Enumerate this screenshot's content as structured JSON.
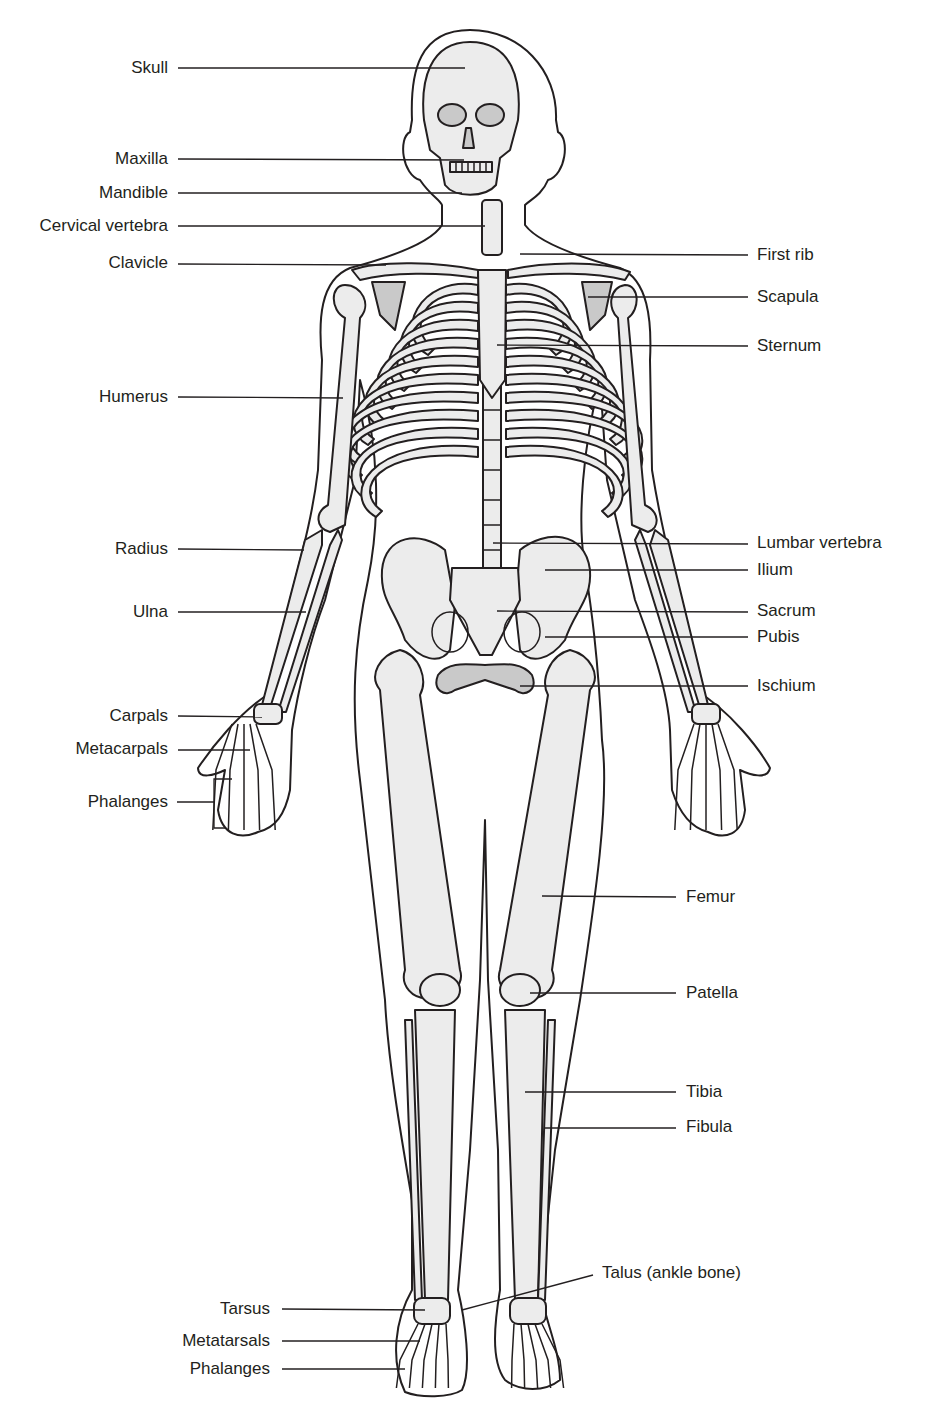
{
  "figure": {
    "colors": {
      "ink": "#231f20",
      "bone_fill": "#ececec",
      "shaded_bone": "#c9c9c9",
      "background": "#ffffff"
    }
  },
  "labels": {
    "left": [
      {
        "id": "skull",
        "text": "Skull"
      },
      {
        "id": "maxilla",
        "text": "Maxilla"
      },
      {
        "id": "mandible",
        "text": "Mandible"
      },
      {
        "id": "cervical-vertebra",
        "text": "Cervical vertebra"
      },
      {
        "id": "clavicle",
        "text": "Clavicle"
      },
      {
        "id": "humerus",
        "text": "Humerus"
      },
      {
        "id": "radius",
        "text": "Radius"
      },
      {
        "id": "ulna",
        "text": "Ulna"
      },
      {
        "id": "carpals",
        "text": "Carpals"
      },
      {
        "id": "metacarpals",
        "text": "Metacarpals"
      },
      {
        "id": "phalanges-hand",
        "text": "Phalanges"
      },
      {
        "id": "tarsus",
        "text": "Tarsus"
      },
      {
        "id": "metatarsals",
        "text": "Metatarsals"
      },
      {
        "id": "phalanges-foot",
        "text": "Phalanges"
      }
    ],
    "right": [
      {
        "id": "first-rib",
        "text": "First rib"
      },
      {
        "id": "scapula",
        "text": "Scapula"
      },
      {
        "id": "sternum",
        "text": "Sternum"
      },
      {
        "id": "lumbar-vertebra",
        "text": "Lumbar vertebra"
      },
      {
        "id": "ilium",
        "text": "Ilium"
      },
      {
        "id": "sacrum",
        "text": "Sacrum"
      },
      {
        "id": "pubis",
        "text": "Pubis"
      },
      {
        "id": "ischium",
        "text": "Ischium"
      },
      {
        "id": "femur",
        "text": "Femur"
      },
      {
        "id": "patella",
        "text": "Patella"
      },
      {
        "id": "tibia",
        "text": "Tibia"
      },
      {
        "id": "fibula",
        "text": "Fibula"
      },
      {
        "id": "talus",
        "text": "Talus (ankle bone)"
      }
    ]
  }
}
